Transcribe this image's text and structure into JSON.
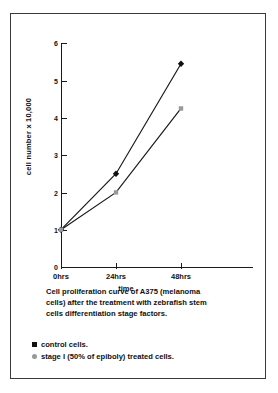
{
  "figure": {
    "background_color": "#ffffff",
    "frame_color": "#3a3a3a"
  },
  "caption": {
    "line1": "Cell proliferation curve of A375 (melanoma",
    "line2": "cells) after the treatment with zebrafish stem",
    "line3": "cells differentiation stage factors."
  },
  "legend": {
    "items": [
      {
        "label": "control cells.",
        "color": "#111111",
        "shape": "square"
      },
      {
        "label": "stage I (50% of epiboly) treated cells.",
        "color": "#999999",
        "shape": "round"
      }
    ]
  },
  "chart_data": {
    "type": "line",
    "title": "",
    "xlabel": "time",
    "ylabel": "cell number x 10,000",
    "categories": [
      "0hrs",
      "24hrs",
      "48hrs"
    ],
    "xtick_labels": [
      "0hrs",
      "24hrs",
      "48hrs"
    ],
    "ytick_labels": [
      "0",
      "1",
      "2",
      "3",
      "4",
      "5",
      "6"
    ],
    "ylim": [
      0,
      6
    ],
    "grid": false,
    "legend_position": "below-caption",
    "series": [
      {
        "name": "control cells.",
        "color": "#111111",
        "marker": "diamond",
        "values": [
          1.0,
          2.5,
          5.45
        ]
      },
      {
        "name": "stage I (50% of epiboly) treated cells.",
        "color": "#999999",
        "marker": "square",
        "values": [
          1.0,
          2.0,
          4.25
        ]
      }
    ]
  }
}
